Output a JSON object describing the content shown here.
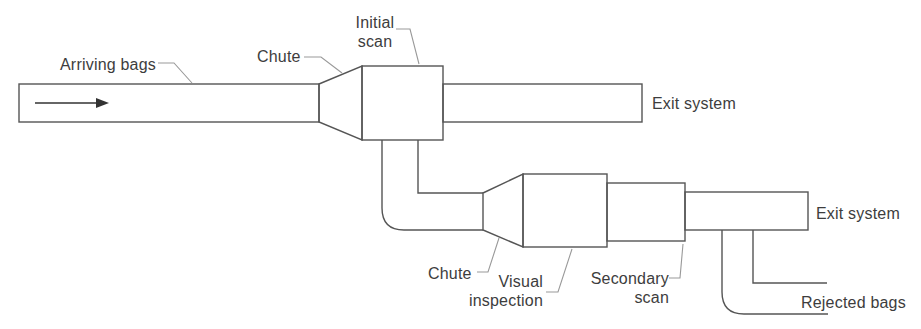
{
  "diagram": {
    "type": "process-flow",
    "description_of_scene": "Baggage handling flow with two scanning stages",
    "labels": {
      "arriving_bags": "Arriving bags",
      "chute_upper": "Chute",
      "initial_scan": [
        "Initial",
        "scan"
      ],
      "exit_system_upper": "Exit system",
      "chute_lower": "Chute",
      "visual_inspection": [
        "Visual",
        "inspection"
      ],
      "secondary_scan": [
        "Secondary",
        "scan"
      ],
      "exit_system_lower": "Exit system",
      "rejected_bags": "Rejected bags"
    },
    "icons": {
      "flow_arrow": "right-arrow"
    },
    "colors": {
      "outline": "#555555",
      "leader_line": "#999999",
      "arrow": "#333333",
      "text": "#3d3d3d",
      "background": "#ffffff"
    }
  }
}
